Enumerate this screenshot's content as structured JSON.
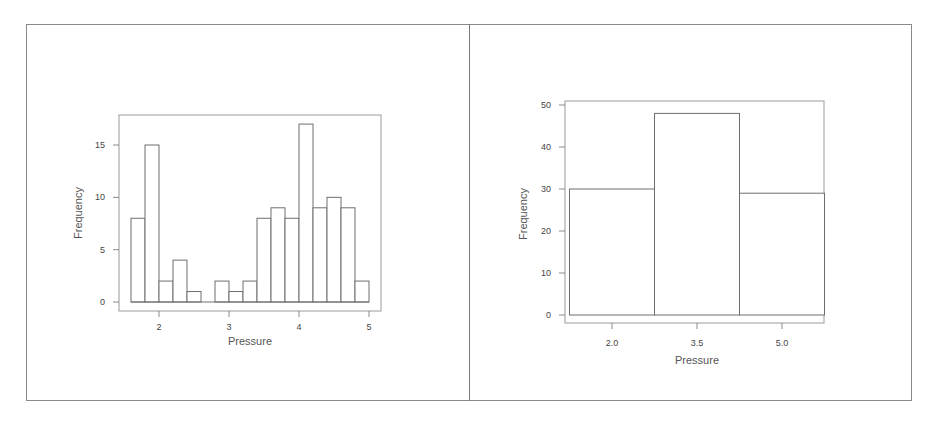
{
  "chart_data": [
    {
      "type": "bar",
      "subtype": "histogram",
      "title": "",
      "xlabel": "Pressure",
      "ylabel": "Frequency",
      "xticks": [
        "2",
        "3",
        "4",
        "5"
      ],
      "yticks": [
        "0",
        "5",
        "10",
        "15"
      ],
      "ylim": [
        0,
        17
      ],
      "xlim": [
        1.6,
        5.0
      ],
      "bin_width": 0.2,
      "bins": [
        {
          "start": 1.6,
          "end": 1.8,
          "count": 8
        },
        {
          "start": 1.8,
          "end": 2.0,
          "count": 15
        },
        {
          "start": 2.0,
          "end": 2.2,
          "count": 2
        },
        {
          "start": 2.2,
          "end": 2.4,
          "count": 4
        },
        {
          "start": 2.4,
          "end": 2.6,
          "count": 1
        },
        {
          "start": 2.6,
          "end": 2.8,
          "count": 0
        },
        {
          "start": 2.8,
          "end": 3.0,
          "count": 2
        },
        {
          "start": 3.0,
          "end": 3.2,
          "count": 1
        },
        {
          "start": 3.2,
          "end": 3.4,
          "count": 2
        },
        {
          "start": 3.4,
          "end": 3.6,
          "count": 8
        },
        {
          "start": 3.6,
          "end": 3.8,
          "count": 9
        },
        {
          "start": 3.8,
          "end": 4.0,
          "count": 8
        },
        {
          "start": 4.0,
          "end": 4.2,
          "count": 17
        },
        {
          "start": 4.2,
          "end": 4.4,
          "count": 9
        },
        {
          "start": 4.4,
          "end": 4.6,
          "count": 10
        },
        {
          "start": 4.6,
          "end": 4.8,
          "count": 9
        },
        {
          "start": 4.8,
          "end": 5.0,
          "count": 2
        }
      ],
      "grid": false,
      "legend": null
    },
    {
      "type": "bar",
      "subtype": "histogram",
      "title": "",
      "xlabel": "Pressure",
      "ylabel": "Frequency",
      "xticks": [
        "2.0",
        "3.5",
        "5.0"
      ],
      "yticks": [
        "0",
        "10",
        "20",
        "30",
        "40",
        "50"
      ],
      "ylim": [
        0,
        50
      ],
      "bin_width": 1.5,
      "bins": [
        {
          "start": 1.25,
          "end": 2.75,
          "count": 30
        },
        {
          "start": 2.75,
          "end": 4.25,
          "count": 48
        },
        {
          "start": 4.25,
          "end": 5.75,
          "count": 29
        }
      ],
      "grid": false,
      "legend": null
    }
  ],
  "style": {
    "bar_fill": "#ffffff",
    "bar_stroke": "#6e6e6e",
    "axis_color": "#8a8a8a",
    "text_color": "#444444"
  }
}
